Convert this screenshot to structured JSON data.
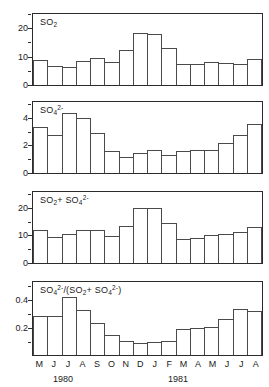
{
  "figure": {
    "width": 269,
    "height": 387,
    "background": "#ffffff",
    "ink_color": "#2b2b2b",
    "bar_edge_color": "#4a4a4a",
    "bar_fill_color": "#ffffff"
  },
  "axis": {
    "categories": [
      "M",
      "J",
      "J",
      "A",
      "S",
      "O",
      "N",
      "D",
      "J",
      "F",
      "M",
      "A",
      "M",
      "J",
      "J",
      "A"
    ],
    "year_labels": [
      {
        "text": "1980",
        "center_index": 2.5
      },
      {
        "text": "1981",
        "center_index": 10.5
      }
    ]
  },
  "panels": [
    {
      "id": "so2",
      "title_html": "SO<sub>2</sub>",
      "title_text": "SO2",
      "ylim": [
        0,
        26
      ],
      "major_ticks": [
        0,
        10,
        20
      ],
      "minor_ticks": [
        5,
        15,
        25
      ],
      "tick_labels": [
        "0",
        "10",
        "20"
      ]
    },
    {
      "id": "so4",
      "title_html": "SO<sub>4</sub><sup>2-</sup>",
      "title_text": "SO4 2-",
      "ylim": [
        0,
        5.2
      ],
      "major_ticks": [
        0,
        2,
        4
      ],
      "minor_ticks": [
        1,
        3,
        5
      ],
      "tick_labels": [
        "0",
        "2",
        "4"
      ]
    },
    {
      "id": "so2-plus-so4",
      "title_html": "SO<sub>2</sub>+ SO<sub>4</sub><sup>2-</sup>",
      "title_text": "SO2 + SO4 2-",
      "ylim": [
        0,
        26
      ],
      "major_ticks": [
        0,
        10,
        20
      ],
      "minor_ticks": [
        5,
        15,
        25
      ],
      "tick_labels": [
        "0",
        "10",
        "20"
      ]
    },
    {
      "id": "ratio",
      "title_html": "SO<sub>4</sub><sup>2-</sup>/(SO<sub>2</sub>+ SO<sub>4</sub><sup>2-</sup>)",
      "title_text": "SO4 2- / (SO2 + SO4 2-)",
      "ylim": [
        0,
        0.52
      ],
      "major_ticks": [
        0.2,
        0.4
      ],
      "minor_ticks": [
        0.1,
        0.3,
        0.5
      ],
      "tick_labels": [
        "0.2",
        "0.4"
      ]
    }
  ],
  "chart_data": [
    {
      "type": "bar",
      "title": "SO2",
      "xlabel": "",
      "ylabel": "SO2",
      "categories": [
        "M",
        "J",
        "J",
        "A",
        "S",
        "O",
        "N",
        "D",
        "J",
        "F",
        "M",
        "A",
        "M",
        "J",
        "J",
        "A"
      ],
      "values": [
        9.0,
        7.1,
        6.5,
        8.8,
        10.0,
        8.6,
        12.7,
        19.1,
        18.8,
        13.5,
        7.7,
        7.7,
        8.3,
        8.0,
        7.7,
        9.6
      ],
      "ylim": [
        0,
        26
      ],
      "yticks": [
        0,
        10,
        20
      ],
      "grid": false,
      "legend": "none"
    },
    {
      "type": "bar",
      "title": "SO4 2-",
      "xlabel": "",
      "ylabel": "SO4 2-",
      "categories": [
        "M",
        "J",
        "J",
        "A",
        "S",
        "O",
        "N",
        "D",
        "J",
        "F",
        "M",
        "A",
        "M",
        "J",
        "J",
        "A"
      ],
      "values": [
        3.4,
        2.8,
        4.4,
        4.0,
        2.9,
        1.6,
        1.2,
        1.5,
        1.65,
        1.35,
        1.6,
        1.7,
        1.7,
        2.2,
        2.75,
        3.6,
        4.2
      ],
      "ylim": [
        0,
        5.2
      ],
      "yticks": [
        0,
        2,
        4
      ],
      "grid": false,
      "legend": "none"
    },
    {
      "type": "bar",
      "title": "SO2 + SO4 2-",
      "xlabel": "",
      "ylabel": "SO2 + SO4 2-",
      "categories": [
        "M",
        "J",
        "J",
        "A",
        "S",
        "O",
        "N",
        "D",
        "J",
        "F",
        "M",
        "A",
        "M",
        "J",
        "J",
        "A"
      ],
      "values": [
        12.2,
        9.7,
        10.6,
        12.2,
        12.2,
        9.9,
        13.5,
        20.1,
        20.1,
        14.5,
        8.9,
        9.0,
        10.1,
        10.5,
        11.2,
        13.2
      ],
      "ylim": [
        0,
        26
      ],
      "yticks": [
        0,
        10,
        20
      ],
      "grid": false,
      "legend": "none"
    },
    {
      "type": "bar",
      "title": "SO4 2- / (SO2 + SO4 2-)",
      "xlabel": "",
      "ylabel": "SO4 2- / (SO2 + SO4 2-)",
      "categories": [
        "M",
        "J",
        "J",
        "A",
        "S",
        "O",
        "N",
        "D",
        "J",
        "F",
        "M",
        "A",
        "M",
        "J",
        "J",
        "A"
      ],
      "values": [
        0.28,
        0.28,
        0.41,
        0.32,
        0.23,
        0.14,
        0.1,
        0.085,
        0.09,
        0.1,
        0.185,
        0.195,
        0.2,
        0.255,
        0.325,
        0.31
      ],
      "ylim": [
        0,
        0.52
      ],
      "yticks": [
        0.2,
        0.4
      ],
      "grid": false,
      "legend": "none"
    }
  ]
}
